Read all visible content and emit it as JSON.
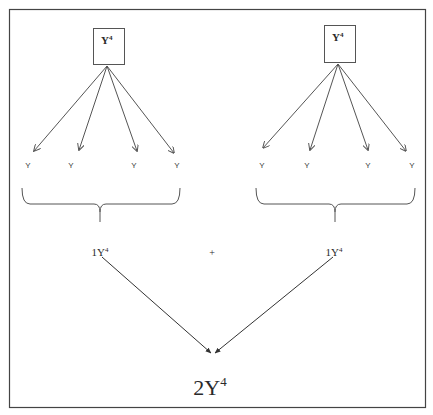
{
  "diagram": {
    "left_group": {
      "box_label": "Y",
      "box_exponent": "4",
      "leaf_labels": [
        "Y",
        "Y",
        "Y",
        "Y"
      ],
      "result_coefficient": "1",
      "result_base": "Y",
      "result_exponent": "4"
    },
    "right_group": {
      "box_label": "Y",
      "box_exponent": "4",
      "leaf_labels": [
        "Y",
        "Y",
        "Y",
        "Y"
      ],
      "result_coefficient": "1",
      "result_base": "Y",
      "result_exponent": "4"
    },
    "operator": "+",
    "final": {
      "coefficient": "2",
      "base": "Y",
      "exponent": "4"
    },
    "colors": {
      "line": "#555555",
      "frame": "#444444",
      "text": "#2a2a2a"
    }
  }
}
